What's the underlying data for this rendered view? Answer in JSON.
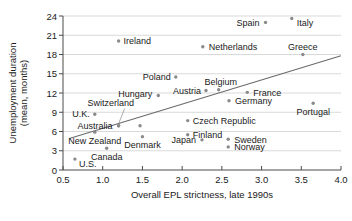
{
  "chart_data": {
    "type": "scatter",
    "title": "",
    "xlabel": "Overall EPL strictness, late 1990s",
    "ylabel": "Unemployment duration (mean, months)",
    "ylabel_line1": "Unemployment duration",
    "ylabel_line2": "(mean, months)",
    "xlim": [
      0.5,
      4.0
    ],
    "ylim": [
      0,
      24
    ],
    "xticks": [
      "0.5",
      "1.0",
      "1.5",
      "2.0",
      "2.5",
      "3.0",
      "3.5",
      "4.0"
    ],
    "xtick_values": [
      0.5,
      1.0,
      1.5,
      2.0,
      2.5,
      3.0,
      3.5,
      4.0
    ],
    "yticks": [
      "0",
      "3",
      "6",
      "9",
      "12",
      "15",
      "18",
      "21",
      "24"
    ],
    "ytick_values": [
      0,
      3,
      6,
      9,
      12,
      15,
      18,
      21,
      24
    ],
    "grid": true,
    "grid_axis": "y",
    "legend": null,
    "point_color": "#8a8a8a",
    "trendline_color": "#6b6b6b",
    "trendline": {
      "x0": 0.58,
      "y0": 4.9,
      "x1": 4.0,
      "y1": 17.8
    },
    "points": [
      {
        "name": "Spain",
        "x": 3.05,
        "y": 23.0,
        "label_dx": -6,
        "label_dy": 3.3,
        "label_anchor": "end"
      },
      {
        "name": "Italy",
        "x": 3.38,
        "y": 23.6,
        "label_dx": 5,
        "label_dy": 7.0,
        "label_anchor": "start"
      },
      {
        "name": "Ireland",
        "x": 1.2,
        "y": 20.1,
        "label_dx": 5,
        "label_dy": 3.4,
        "label_anchor": "start"
      },
      {
        "name": "Netherlands",
        "x": 2.26,
        "y": 19.2,
        "label_dx": 6,
        "label_dy": 3.3,
        "label_anchor": "start"
      },
      {
        "name": "Greece",
        "x": 3.52,
        "y": 18.0,
        "label_dx": 0,
        "label_dy": -5.0,
        "label_anchor": "middle"
      },
      {
        "name": "Poland",
        "x": 1.92,
        "y": 14.5,
        "label_dx": -5,
        "label_dy": 3.3,
        "label_anchor": "end"
      },
      {
        "name": "Belgium",
        "x": 2.46,
        "y": 12.5,
        "label_dx": 2,
        "label_dy": -5.0,
        "label_anchor": "middle"
      },
      {
        "name": "Austria",
        "x": 2.3,
        "y": 12.4,
        "label_dx": -5,
        "label_dy": 3.3,
        "label_anchor": "end"
      },
      {
        "name": "France",
        "x": 2.82,
        "y": 12.1,
        "label_dx": 6,
        "label_dy": 3.3,
        "label_anchor": "start"
      },
      {
        "name": "Hungary",
        "x": 1.7,
        "y": 11.6,
        "label_dx": -6,
        "label_dy": 1.8,
        "label_anchor": "end"
      },
      {
        "name": "Germany",
        "x": 2.59,
        "y": 10.8,
        "label_dx": 6,
        "label_dy": 3.4,
        "label_anchor": "start"
      },
      {
        "name": "Portugal",
        "x": 3.65,
        "y": 10.4,
        "label_dx": 0,
        "label_dy": 11.5,
        "label_anchor": "middle"
      },
      {
        "name": "Switzerland",
        "x": 1.2,
        "y": 6.9,
        "label_dx": 0,
        "label_dy": 0,
        "label_anchor": "middle",
        "leader": true,
        "label_x": 1.1,
        "label_y": 9.9
      },
      {
        "name": "U.K.",
        "x": 0.9,
        "y": 8.7,
        "label_dx": -5,
        "label_dy": 3.3,
        "label_anchor": "end"
      },
      {
        "name": "Czech Republic",
        "x": 2.07,
        "y": 7.7,
        "label_dx": 5,
        "label_dy": 3.3,
        "label_anchor": "start"
      },
      {
        "name": "Australia",
        "x": 1.2,
        "y": 6.9,
        "label_dx": -6,
        "label_dy": 3.2,
        "label_anchor": "end"
      },
      {
        "name": "Finland",
        "x": 2.07,
        "y": 5.5,
        "label_dx": 5,
        "label_dy": 3.3,
        "label_anchor": "start"
      },
      {
        "name": "New Zealand",
        "x": 0.9,
        "y": 5.9,
        "label_dx": 0,
        "label_dy": 11.5,
        "label_anchor": "middle"
      },
      {
        "name": "Denmark",
        "x": 1.5,
        "y": 5.2,
        "label_dx": 0,
        "label_dy": 11.5,
        "label_anchor": "middle"
      },
      {
        "name": "Sweden",
        "x": 2.58,
        "y": 4.8,
        "label_dx": 6,
        "label_dy": 3.3,
        "label_anchor": "start"
      },
      {
        "name": "Japan",
        "x": 2.25,
        "y": 4.7,
        "label_dx": -6,
        "label_dy": 3.3,
        "label_anchor": "end"
      },
      {
        "name": "Norway",
        "x": 2.58,
        "y": 3.6,
        "label_dx": 6,
        "label_dy": 3.3,
        "label_anchor": "start"
      },
      {
        "name": "Canada",
        "x": 1.05,
        "y": 3.4,
        "label_dx": 0,
        "label_dy": 11.5,
        "label_anchor": "middle"
      },
      {
        "name": "U.S.",
        "x": 0.65,
        "y": 1.7,
        "label_dx": 4,
        "label_dy": 8.0,
        "label_anchor": "start"
      },
      {
        "name": "Australia-dot2",
        "x": 1.47,
        "y": 6.9,
        "hide_label": true
      }
    ]
  }
}
